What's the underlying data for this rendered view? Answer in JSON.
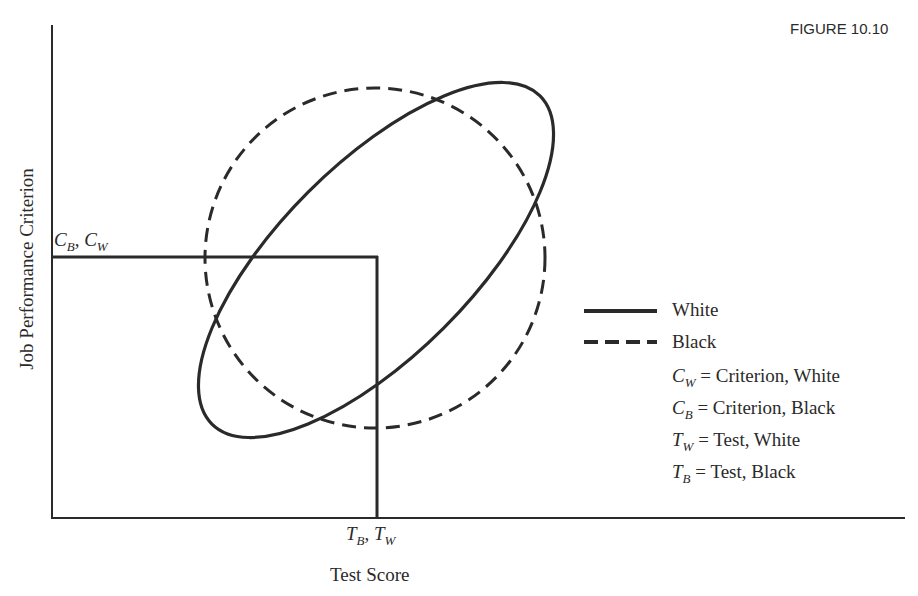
{
  "figure": {
    "label": "FIGURE 10.10",
    "x_axis_label": "Test Score",
    "y_axis_label": "Job Performance Criterion",
    "criterion_marker": {
      "c1": "C",
      "s1": "B",
      "sep": ", ",
      "c2": "C",
      "s2": "W"
    },
    "test_marker": {
      "c1": "T",
      "s1": "B",
      "sep": ", ",
      "c2": "T",
      "s2": "W"
    },
    "legend": {
      "solid": "White",
      "dashed": "Black",
      "defs": [
        {
          "sym": "C",
          "sub": "W",
          "text": " = Criterion, White"
        },
        {
          "sym": "C",
          "sub": "B",
          "text": " = Criterion, Black"
        },
        {
          "sym": "T",
          "sub": "W",
          "text": " = Test, White"
        },
        {
          "sym": "T",
          "sub": "B",
          "text": " = Test, Black"
        }
      ]
    },
    "colors": {
      "ink": "#2a2a2a",
      "background": "#ffffff"
    }
  }
}
